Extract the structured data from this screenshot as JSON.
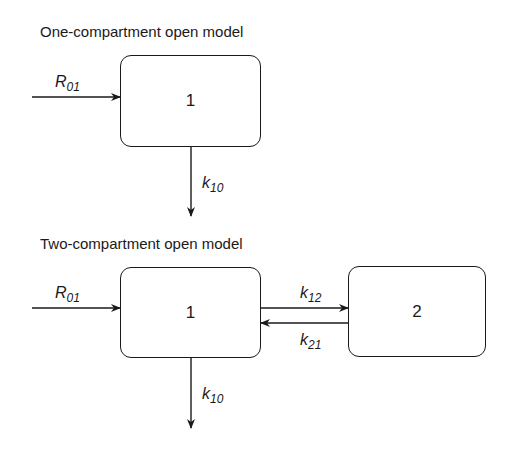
{
  "diagrams": [
    {
      "title": "One-compartment open model",
      "compartments": [
        {
          "label": "1"
        }
      ],
      "input": {
        "symbol": "R",
        "subscript": "01"
      },
      "elimination": {
        "symbol": "k",
        "subscript": "10"
      }
    },
    {
      "title": "Two-compartment open model",
      "compartments": [
        {
          "label": "1"
        },
        {
          "label": "2"
        }
      ],
      "input": {
        "symbol": "R",
        "subscript": "01"
      },
      "transfer_forward": {
        "symbol": "k",
        "subscript": "12"
      },
      "transfer_backward": {
        "symbol": "k",
        "subscript": "21"
      },
      "elimination": {
        "symbol": "k",
        "subscript": "10"
      }
    }
  ]
}
